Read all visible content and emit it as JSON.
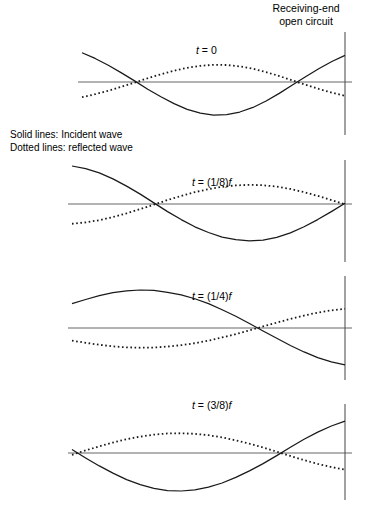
{
  "figure": {
    "title_line1": "Receiving-end",
    "title_line2": "open circuit",
    "legend_line1": "Solid lines: Incident wave",
    "legend_line2": "Dotted lines: reflected wave",
    "stroke_color": "#1a1a1a",
    "axis_color": "#555555",
    "background": "#ffffff"
  },
  "panels": [
    {
      "id": "panel-t0",
      "label_t": "t",
      "label_eq": " = 0",
      "label_full": "t = 0",
      "label_x": 196,
      "label_y": 44,
      "axis_y": 82,
      "axis_x_start": 78,
      "axis_x_end": 352,
      "vline_x": 345,
      "vline_top": 32,
      "vline_bottom": 135,
      "incident_phase_deg": 140,
      "reflected_phase_deg": -140
    },
    {
      "id": "panel-t18",
      "label_t": "t",
      "label_eq": " = (1/8)",
      "label_f": "f",
      "label_full": "t = (1/8)f",
      "label_x": 192,
      "label_y": 176,
      "axis_y": 204,
      "axis_x_start": 68,
      "axis_x_end": 352,
      "vline_x": 345,
      "vline_top": 160,
      "vline_bottom": 262,
      "incident_phase_deg": 185,
      "reflected_phase_deg": -185
    },
    {
      "id": "panel-t14",
      "label_t": "t",
      "label_eq": " = (1/4)",
      "label_f": "f",
      "label_full": "t = (1/4)f",
      "label_x": 192,
      "label_y": 290,
      "axis_y": 328,
      "axis_x_start": 68,
      "axis_x_end": 352,
      "vline_x": 345,
      "vline_top": 276,
      "vline_bottom": 380,
      "incident_phase_deg": 230,
      "reflected_phase_deg": -230
    },
    {
      "id": "panel-t38",
      "label_t": "t",
      "label_eq": " = (3/8)",
      "label_f": "f",
      "label_full": "t = (3/8)f",
      "label_x": 192,
      "label_y": 399,
      "axis_y": 453,
      "axis_x_start": 68,
      "axis_x_end": 352,
      "vline_x": 345,
      "vline_top": 404,
      "vline_bottom": 500,
      "incident_phase_deg": 275,
      "reflected_phase_deg": -275
    }
  ],
  "chart_data": {
    "type": "line",
    "title": "Receiving-end open circuit",
    "xlabel": "",
    "ylabel": "",
    "grid": false,
    "legend_position": "left-middle",
    "legend": [
      "Solid lines: Incident wave",
      "Dotted lines: reflected wave"
    ],
    "annotations": [
      "t = 0",
      "t = (1/8)f",
      "t = (1/4)f",
      "t = (3/8)f"
    ],
    "x": [
      0,
      0.05,
      0.1,
      0.15,
      0.2,
      0.25,
      0.3,
      0.35,
      0.4,
      0.45,
      0.5,
      0.55,
      0.6,
      0.65,
      0.7,
      0.75,
      0.8,
      0.85,
      0.9,
      0.95,
      1.0
    ],
    "panels": [
      {
        "label": "t = 0",
        "series": [
          {
            "name": "Incident wave",
            "style": "solid",
            "values": [
              0.77,
              0.62,
              0.44,
              0.24,
              0.03,
              -0.19,
              -0.39,
              -0.57,
              -0.72,
              -0.82,
              -0.87,
              -0.86,
              -0.79,
              -0.67,
              -0.5,
              -0.3,
              -0.08,
              0.14,
              0.35,
              0.54,
              0.7
            ]
          },
          {
            "name": "Reflected wave",
            "style": "dotted",
            "values": [
              -0.77,
              -0.62,
              -0.44,
              -0.24,
              -0.03,
              0.19,
              0.39,
              0.57,
              0.72,
              0.82,
              0.87,
              0.86,
              0.79,
              0.67,
              0.5,
              0.3,
              0.08,
              -0.14,
              -0.35,
              -0.54,
              -0.7
            ]
          }
        ]
      },
      {
        "label": "t = (1/8)f",
        "series": [
          {
            "name": "Incident wave",
            "style": "solid",
            "values": [
              1.0,
              0.93,
              0.82,
              0.66,
              0.47,
              0.26,
              0.03,
              -0.2,
              -0.41,
              -0.6,
              -0.75,
              -0.87,
              -0.94,
              -0.97,
              -0.95,
              -0.88,
              -0.76,
              -0.6,
              -0.41,
              -0.2,
              0.02
            ]
          },
          {
            "name": "Reflected wave",
            "style": "dotted",
            "values": [
              -1.0,
              -0.93,
              -0.82,
              -0.66,
              -0.47,
              -0.26,
              -0.03,
              0.2,
              0.41,
              0.6,
              0.75,
              0.87,
              0.94,
              0.97,
              0.95,
              0.88,
              0.76,
              0.6,
              0.41,
              0.2,
              -0.02
            ]
          }
        ]
      },
      {
        "label": "t = (1/4)f",
        "series": [
          {
            "name": "Incident wave",
            "style": "solid",
            "values": [
              0.64,
              0.75,
              0.85,
              0.93,
              0.98,
              1.0,
              0.99,
              0.94,
              0.87,
              0.77,
              0.64,
              0.48,
              0.31,
              0.12,
              -0.08,
              -0.27,
              -0.46,
              -0.63,
              -0.78,
              -0.89,
              -0.97
            ]
          },
          {
            "name": "Reflected wave",
            "style": "dotted",
            "values": [
              -0.64,
              -0.75,
              -0.85,
              -0.93,
              -0.98,
              -1.0,
              -0.99,
              -0.94,
              -0.87,
              -0.77,
              -0.64,
              -0.48,
              -0.31,
              -0.12,
              0.08,
              0.27,
              0.46,
              0.63,
              0.78,
              0.89,
              0.97
            ]
          }
        ]
      },
      {
        "label": "t = (3/8)f",
        "series": [
          {
            "name": "Incident wave",
            "style": "solid",
            "values": [
              0.09,
              -0.13,
              -0.34,
              -0.53,
              -0.7,
              -0.83,
              -0.93,
              -0.99,
              -1.0,
              -0.97,
              -0.9,
              -0.79,
              -0.64,
              -0.47,
              -0.28,
              -0.07,
              0.15,
              0.36,
              0.55,
              0.71,
              0.84
            ]
          },
          {
            "name": "Reflected wave",
            "style": "dotted",
            "values": [
              -0.09,
              0.13,
              0.34,
              0.53,
              0.7,
              0.83,
              0.93,
              0.99,
              1.0,
              0.97,
              0.9,
              0.79,
              0.64,
              0.47,
              0.28,
              0.07,
              -0.15,
              -0.36,
              -0.55,
              -0.71,
              -0.84
            ]
          }
        ]
      }
    ]
  }
}
